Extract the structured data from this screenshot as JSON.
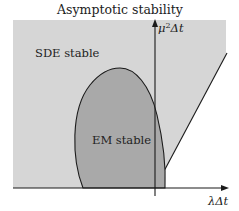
{
  "title": "Asymptotic stability",
  "regions": {
    "sde": {
      "label": "SDE stable",
      "color": "#d6d6d6"
    },
    "em": {
      "label": "EM stable",
      "color": "#a9a9a9"
    }
  },
  "axes": {
    "x_label": "λΔt",
    "y_label_base": "μ",
    "y_label_sup": "2",
    "y_label_rest": "Δt"
  },
  "colors": {
    "line": "#1a1a1a",
    "background": "#ffffff"
  }
}
